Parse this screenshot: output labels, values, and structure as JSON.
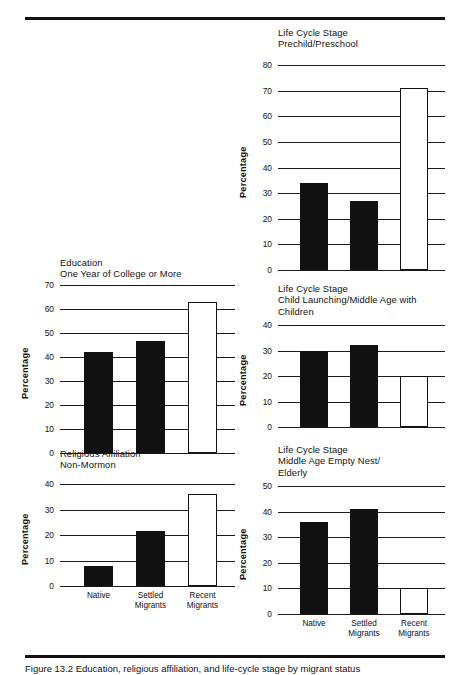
{
  "figure": {
    "caption": "Figure 13.2   Education, religious affiliation, and life-cycle stage by migrant status",
    "categories": [
      "Native",
      "Settled\nMigrants",
      "Recent\nMigrants"
    ],
    "ylabel": "Percentage",
    "colors": {
      "ink": "#111111",
      "native": "#111111",
      "settled": "#111111",
      "recent": "#ffffff"
    }
  },
  "chart_data": [
    {
      "id": "prechild-preschool",
      "type": "bar",
      "title": "Life Cycle Stage\nPrechild/Preschool",
      "title_lines": [
        "Life Cycle Stage",
        "Prechild/Preschool"
      ],
      "categories": [
        "Native",
        "Settled Migrants",
        "Recent Migrants"
      ],
      "values": [
        34,
        27,
        71
      ],
      "ylabel": "Percentage",
      "xlabel": "",
      "ylim": [
        0,
        80
      ],
      "yticks": [
        0,
        10,
        20,
        30,
        40,
        50,
        60,
        70,
        80
      ],
      "grid": true,
      "legend": "none",
      "bar_styles": [
        "filled",
        "filled",
        "open"
      ]
    },
    {
      "id": "education-college",
      "type": "bar",
      "title": "Education\nOne Year of College or More",
      "title_lines": [
        "Education",
        "One Year of College or More"
      ],
      "categories": [
        "Native",
        "Settled Migrants",
        "Recent Migrants"
      ],
      "values": [
        42,
        46.5,
        63
      ],
      "ylabel": "Percentage",
      "xlabel": "",
      "ylim": [
        0,
        70
      ],
      "yticks": [
        0,
        10,
        20,
        30,
        40,
        50,
        60,
        70
      ],
      "grid": true,
      "legend": "none",
      "bar_styles": [
        "filled",
        "filled",
        "open"
      ]
    },
    {
      "id": "child-launching",
      "type": "bar",
      "title": "Life Cycle Stage\nChild Launching/Middle Age with\nChildren",
      "title_lines": [
        "Life Cycle Stage",
        "Child Launching/Middle Age with",
        "Children"
      ],
      "categories": [
        "Native",
        "Settled Migrants",
        "Recent Migrants"
      ],
      "values": [
        30,
        32,
        20
      ],
      "ylabel": "Percentage",
      "xlabel": "",
      "ylim": [
        0,
        40
      ],
      "yticks": [
        0,
        10,
        20,
        30,
        40
      ],
      "grid": true,
      "legend": "none",
      "bar_styles": [
        "filled",
        "filled",
        "open"
      ]
    },
    {
      "id": "religious-affiliation",
      "type": "bar",
      "title": "Religious Affiliation\nNon-Mormon",
      "title_lines": [
        "Religious Affiliation",
        "Non-Mormon"
      ],
      "categories": [
        "Native",
        "Settled Migrants",
        "Recent Migrants"
      ],
      "values": [
        8,
        21.5,
        36
      ],
      "ylabel": "Percentage",
      "xlabel": "",
      "ylim": [
        0,
        40
      ],
      "yticks": [
        0,
        10,
        20,
        30,
        40
      ],
      "grid": true,
      "legend": "none",
      "bar_styles": [
        "filled",
        "filled",
        "open"
      ]
    },
    {
      "id": "empty-nest-elderly",
      "type": "bar",
      "title": "Life Cycle Stage\nMiddle Age Empty Nest/\nElderly",
      "title_lines": [
        "Life Cycle Stage",
        "Middle Age Empty Nest/",
        "Elderly"
      ],
      "categories": [
        "Native",
        "Settled Migrants",
        "Recent Migrants"
      ],
      "values": [
        36,
        41,
        10
      ],
      "ylabel": "Percentage",
      "xlabel": "",
      "ylim": [
        0,
        50
      ],
      "yticks": [
        0,
        10,
        20,
        30,
        40,
        50
      ],
      "grid": true,
      "legend": "none",
      "bar_styles": [
        "filled",
        "filled",
        "open"
      ]
    }
  ]
}
